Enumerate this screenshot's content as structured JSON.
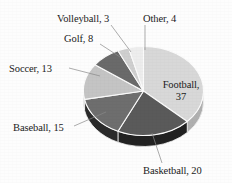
{
  "background_color": "#fdfdfd",
  "chart_data": {
    "type": "pie",
    "title": "",
    "total": 100,
    "start_angle_deg": 0,
    "direction": "clockwise",
    "three_d": true,
    "legend": "none",
    "labels_position": "outside-with-leader-lines",
    "categories": [
      "Football",
      "Basketball",
      "Baseball",
      "Soccer",
      "Golf",
      "Volleyball",
      "Other"
    ],
    "values": [
      37,
      20,
      15,
      13,
      8,
      3,
      4
    ],
    "slices": [
      {
        "label": "Football",
        "value": 37,
        "text": "Football, 37",
        "color": "#d8d8d8",
        "side_color": "#b0b0b0"
      },
      {
        "label": "Basketball",
        "value": 20,
        "text": "Basketball, 20",
        "color": "#5a5a5a",
        "side_color": "#222222"
      },
      {
        "label": "Baseball",
        "value": 15,
        "text": "Baseball, 15",
        "color": "#6e6e6e",
        "side_color": "#2b2b2b"
      },
      {
        "label": "Soccer",
        "value": 13,
        "text": "Soccer, 13",
        "color": "#c4c4c4",
        "side_color": "#8e8e8e"
      },
      {
        "label": "Golf",
        "value": 8,
        "text": "Golf, 8",
        "color": "#6a6a6a",
        "side_color": "#2b2b2b"
      },
      {
        "label": "Volleyball",
        "value": 3,
        "text": "Volleyball, 3",
        "color": "#cfcfcf",
        "side_color": "#9a9a9a"
      },
      {
        "label": "Other",
        "value": 4,
        "text": "Other, 4",
        "color": "#ededed",
        "side_color": "#bdbdbd"
      }
    ]
  },
  "labels": {
    "football": "Football,",
    "football_value": "37",
    "basketball": "Basketball, 20",
    "baseball": "Baseball, 15",
    "soccer": "Soccer, 13",
    "golf": "Golf, 8",
    "volleyball": "Volleyball, 3",
    "other": "Other, 4"
  }
}
